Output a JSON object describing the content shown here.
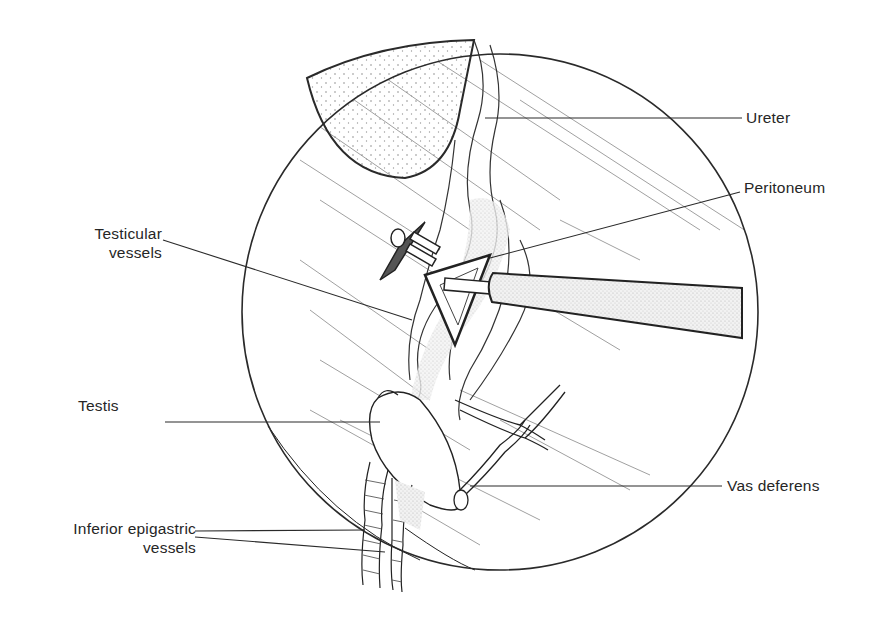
{
  "figure": {
    "view": "laparoscopic view (circular field)",
    "colors": {
      "ink": "#2a2a2a",
      "background": "#ffffff",
      "stipple": "#9a9a9a"
    }
  },
  "labels": {
    "ureter": "Ureter",
    "peritoneum": "Peritoneum",
    "testicular_vessels": {
      "line1": "Testicular",
      "line2": "vessels"
    },
    "testis": "Testis",
    "vas_deferens": "Vas deferens",
    "inferior_epigastric_vessels": {
      "line1": "Inferior epigastric",
      "line2": "vessels"
    }
  }
}
